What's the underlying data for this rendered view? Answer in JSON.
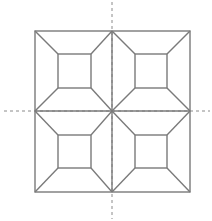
{
  "diagram": {
    "type": "geometric-tiling",
    "colors": {
      "background": "#ffffff",
      "stroke": "#7a7a7a",
      "axis": "#8a8a8a"
    },
    "outer_square": {
      "x1": 35,
      "y1": 31,
      "x2": 190,
      "y2": 192
    },
    "center": {
      "x": 112,
      "y": 111
    },
    "axes": {
      "vertical": {
        "x": 112,
        "y1": 2,
        "y2": 219,
        "style": "dashed"
      },
      "horizontal": {
        "y": 111,
        "x1": 4,
        "x2": 210,
        "style": "dashed"
      }
    },
    "quadrants": [
      {
        "name": "top-left",
        "outer": [
          35,
          31,
          112,
          111
        ],
        "inner": [
          58,
          54,
          91,
          88
        ]
      },
      {
        "name": "top-right",
        "outer": [
          112,
          31,
          190,
          111
        ],
        "inner": [
          135,
          54,
          167,
          88
        ]
      },
      {
        "name": "bottom-left",
        "outer": [
          35,
          111,
          112,
          192
        ],
        "inner": [
          58,
          135,
          91,
          168
        ]
      },
      {
        "name": "bottom-right",
        "outer": [
          112,
          111,
          190,
          192
        ],
        "inner": [
          135,
          135,
          167,
          168
        ]
      }
    ]
  }
}
